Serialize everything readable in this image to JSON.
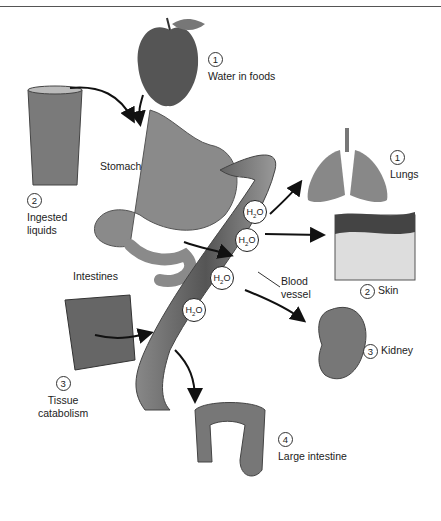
{
  "figure": {
    "sources": [
      {
        "num": "1",
        "label": "Water in foods"
      },
      {
        "num": "2",
        "label_lines": [
          "Ingested",
          "liquids"
        ]
      },
      {
        "num": "3",
        "label_lines": [
          "Tissue",
          "catabolism"
        ]
      }
    ],
    "organs": {
      "stomach": "Stomach",
      "intestines": "Intestines",
      "blood_vessel_lines": [
        "Blood",
        "vessel"
      ]
    },
    "outputs": [
      {
        "num": "1",
        "label": "Lungs"
      },
      {
        "num": "2",
        "label": "Skin"
      },
      {
        "num": "3",
        "label": "Kidney"
      },
      {
        "num": "4",
        "label": "Large intestine"
      }
    ],
    "molecule": {
      "h": "H",
      "sub": "2",
      "o": "O"
    }
  }
}
